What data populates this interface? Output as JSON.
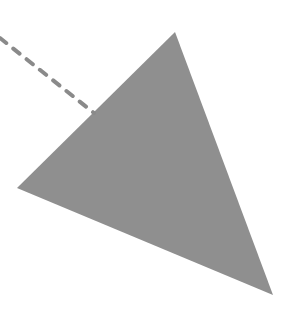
{
  "diagram": {
    "colors": {
      "background": "#ffffff",
      "triangle_fill": "#8f8f8f",
      "dashed_line": "#8a8a8a"
    },
    "shapes": [
      {
        "kind": "triangle",
        "name": "gray-triangle"
      },
      {
        "kind": "dashed-line",
        "name": "dashed-line"
      }
    ]
  }
}
